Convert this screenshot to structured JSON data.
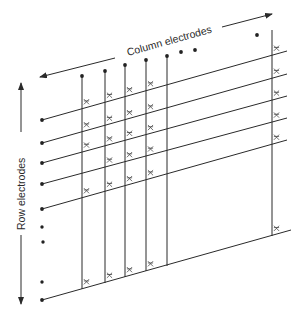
{
  "diagram": {
    "type": "electrode-matrix",
    "labels": {
      "column": "Column electrodes",
      "row": "Row electrodes"
    },
    "colors": {
      "ink": "#2a2a2a",
      "background": "#ffffff"
    },
    "row_slope": -0.28,
    "row_lines": [
      {
        "x1": 42,
        "y1": 120,
        "x2": 287,
        "y2": 51
      },
      {
        "x1": 42,
        "y1": 143,
        "x2": 287,
        "y2": 74
      },
      {
        "x1": 42,
        "y1": 163,
        "x2": 287,
        "y2": 96
      },
      {
        "x1": 42,
        "y1": 184,
        "x2": 287,
        "y2": 118
      },
      {
        "x1": 42,
        "y1": 209,
        "x2": 287,
        "y2": 140
      },
      {
        "x1": 42,
        "y1": 300,
        "x2": 291,
        "y2": 230
      }
    ],
    "row_extra_dots": [
      {
        "x": 42,
        "y": 227
      },
      {
        "x": 43,
        "y": 242
      },
      {
        "x": 42,
        "y": 282
      }
    ],
    "column_lines": [
      {
        "x": 82,
        "top": 76,
        "bottom": 289
      },
      {
        "x": 105,
        "top": 71,
        "bottom": 283
      },
      {
        "x": 125,
        "top": 65,
        "bottom": 277
      },
      {
        "x": 146,
        "top": 60,
        "bottom": 271
      },
      {
        "x": 167,
        "top": 56,
        "bottom": 266
      },
      {
        "x": 272,
        "top": 30,
        "bottom": 236
      }
    ],
    "column_dots": [
      {
        "x": 82,
        "y": 76
      },
      {
        "x": 105,
        "y": 71
      },
      {
        "x": 125,
        "y": 65
      },
      {
        "x": 146,
        "y": 60
      },
      {
        "x": 167,
        "y": 56
      },
      {
        "x": 181,
        "y": 52
      },
      {
        "x": 195,
        "y": 50
      },
      {
        "x": 257,
        "y": 35
      }
    ],
    "crosspoint_marks": [
      {
        "col": 0,
        "rows": [
          0,
          1,
          2,
          4,
          5
        ]
      },
      {
        "col": 1,
        "rows": [
          0,
          1,
          2,
          3,
          4,
          5
        ]
      },
      {
        "col": 2,
        "rows": [
          0,
          1,
          2,
          3,
          4,
          5
        ]
      },
      {
        "col": 3,
        "rows": [
          0,
          1,
          2,
          3,
          4,
          5
        ]
      },
      {
        "col": 5,
        "rows": [
          0,
          1,
          2,
          3,
          4,
          5
        ]
      }
    ],
    "arrows": {
      "column_left": {
        "x1": 115,
        "y1": 58,
        "x2": 40,
        "y2": 77
      },
      "column_right": {
        "x1": 222,
        "y1": 27,
        "x2": 272,
        "y2": 14
      },
      "row_up": {
        "x1": 21,
        "y1": 132,
        "x2": 21,
        "y2": 83
      },
      "row_down": {
        "x1": 21,
        "y1": 235,
        "x2": 21,
        "y2": 304
      }
    }
  }
}
